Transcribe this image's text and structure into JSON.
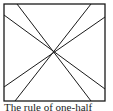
{
  "diagram": {
    "type": "square-with-crossing-lines",
    "square": {
      "x": 4,
      "y": 4,
      "width": 101,
      "height": 97
    },
    "center": {
      "x": 53,
      "y": 52
    },
    "lines": [
      {
        "x1": 17,
        "y1": 4,
        "x2": 91,
        "y2": 101
      },
      {
        "x1": 91,
        "y1": 4,
        "x2": 15,
        "y2": 101
      },
      {
        "x1": 4,
        "y1": 15,
        "x2": 105,
        "y2": 89
      },
      {
        "x1": 105,
        "y1": 17,
        "x2": 4,
        "y2": 87
      }
    ],
    "stroke_color": "#1a1a1a"
  },
  "caption": {
    "text": "The rule of one-half"
  }
}
